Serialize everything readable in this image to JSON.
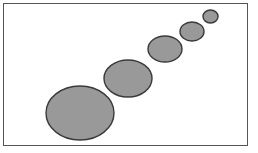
{
  "figure": {
    "title": "",
    "background_color": "#ffffff",
    "width": 258,
    "height": 153
  },
  "frame": {
    "name": "plot-frame",
    "x": 3,
    "y": 3,
    "width": 244,
    "height": 142,
    "stroke_color": "#555555",
    "stroke_width": 1,
    "fill_color": "#ffffff"
  },
  "style": {
    "bubble_fill": "#999999",
    "bubble_stroke": "#3a3a3a",
    "bubble_stroke_width": 1.4
  },
  "chart_data": {
    "type": "scatter",
    "title": "",
    "subtitle": "",
    "xlabel": "",
    "ylabel": "",
    "xlim": [
      0,
      258
    ],
    "ylim": [
      0,
      153
    ],
    "grid": false,
    "legend": false,
    "legend_position": "none",
    "axis_ticks_visible": false,
    "marker": "ellipse",
    "note": "Five gray ellipse bubbles decreasing in size from lower-left to upper-right; sizes given as pixel radii in figure coordinates (y measured downward from top).",
    "points": [
      {
        "label": "bubble-1",
        "cx": 80,
        "cy": 113,
        "rx": 34,
        "ry": 27,
        "size_rank": 1
      },
      {
        "label": "bubble-2",
        "cx": 128,
        "cy": 78.5,
        "rx": 24,
        "ry": 18.5,
        "size_rank": 2
      },
      {
        "label": "bubble-3",
        "cx": 165,
        "cy": 49,
        "rx": 17,
        "ry": 13,
        "size_rank": 3
      },
      {
        "label": "bubble-4",
        "cx": 192,
        "cy": 31.5,
        "rx": 12,
        "ry": 9.5,
        "size_rank": 4
      },
      {
        "label": "bubble-5",
        "cx": 210.5,
        "cy": 16.5,
        "rx": 7.5,
        "ry": 6.5,
        "size_rank": 5
      }
    ]
  }
}
